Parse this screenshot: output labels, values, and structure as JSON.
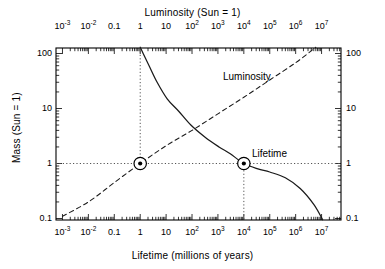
{
  "chart_data": {
    "type": "line",
    "title": "",
    "xlabel": "Lifetime (millions of years)",
    "xlabel_top": "Luminosity (Sun = 1)",
    "ylabel": "Mass (Sun = 1)",
    "ylabel_right": "Mass (Sun = 1)",
    "xscale": "log",
    "yscale": "log",
    "xlim": [
      0.0002,
      20000000
    ],
    "ylim": [
      0.075,
      160
    ],
    "grid": false,
    "xticks_bottom": [
      "10⁻³",
      "10⁻²",
      "0.1",
      "1",
      "10",
      "10²",
      "10³",
      "10⁴",
      "10⁵",
      "10⁶",
      "10⁷"
    ],
    "xticks_top": [
      "10⁻³",
      "10⁻²",
      "0.1",
      "1",
      "10",
      "10²",
      "10³",
      "10⁴",
      "10⁵",
      "10⁶",
      "10⁷"
    ],
    "yticks_left": [
      "100",
      "10",
      "1",
      "0.1"
    ],
    "yticks_right": [
      "100",
      "10",
      "1",
      "0.1"
    ],
    "series": [
      {
        "name": "Lifetime",
        "style": "solid",
        "label": "Lifetime",
        "axis": "bottom",
        "comment": "stellar lifetime in millions of years vs mass (solar units)",
        "points": [
          {
            "lifetime": 1.0,
            "mass": 130
          },
          {
            "lifetime": 1.3,
            "mass": 100
          },
          {
            "lifetime": 2.2,
            "mass": 60
          },
          {
            "lifetime": 4.5,
            "mass": 30
          },
          {
            "lifetime": 11,
            "mass": 15
          },
          {
            "lifetime": 30,
            "mass": 9
          },
          {
            "lifetime": 90,
            "mass": 5
          },
          {
            "lifetime": 320,
            "mass": 3
          },
          {
            "lifetime": 1100,
            "mass": 2
          },
          {
            "lifetime": 3000,
            "mass": 1.5
          },
          {
            "lifetime": 10000,
            "mass": 1.0
          },
          {
            "lifetime": 35000,
            "mass": 0.8
          },
          {
            "lifetime": 100000,
            "mass": 0.7
          },
          {
            "lifetime": 400000,
            "mass": 0.55
          },
          {
            "lifetime": 1500000,
            "mass": 0.35
          },
          {
            "lifetime": 5000000,
            "mass": 0.18
          },
          {
            "lifetime": 11000000,
            "mass": 0.095
          }
        ]
      },
      {
        "name": "Luminosity",
        "style": "dashed",
        "label": "Luminosity",
        "axis": "top",
        "comment": "luminosity in solar units vs mass (solar units)",
        "points": [
          {
            "luminosity": 0.0004,
            "mass": 0.085
          },
          {
            "luminosity": 0.001,
            "mass": 0.11
          },
          {
            "luminosity": 0.01,
            "mass": 0.2
          },
          {
            "luminosity": 0.1,
            "mass": 0.45
          },
          {
            "luminosity": 1.0,
            "mass": 1.0
          },
          {
            "luminosity": 10,
            "mass": 2.1
          },
          {
            "luminosity": 100,
            "mass": 4.0
          },
          {
            "luminosity": 1000,
            "mass": 8.0
          },
          {
            "luminosity": 10000,
            "mass": 16
          },
          {
            "luminosity": 100000,
            "mass": 33
          },
          {
            "luminosity": 1000000,
            "mass": 68
          },
          {
            "luminosity": 6000000,
            "mass": 130
          }
        ]
      }
    ],
    "markers": [
      {
        "name": "sun-luminosity-marker",
        "axis": "top",
        "x": 1.0,
        "y": 1.0,
        "style": "circle-with-dot"
      },
      {
        "name": "sun-lifetime-marker",
        "axis": "bottom",
        "x": 10000,
        "y": 1.0,
        "style": "circle-with-dot"
      }
    ],
    "reference_lines": [
      {
        "name": "luminosity-one-line",
        "orientation": "vertical",
        "axis": "top",
        "value": 1.0,
        "style": "dotted"
      },
      {
        "name": "mass-one-line",
        "orientation": "horizontal",
        "value": 1.0,
        "style": "dotted"
      },
      {
        "name": "lifetime-sun-line",
        "orientation": "vertical",
        "axis": "bottom",
        "value": 10000,
        "style": "dotted"
      }
    ],
    "annotations": [
      {
        "name": "luminosity-curve-label",
        "text": "Luminosity"
      },
      {
        "name": "lifetime-curve-label",
        "text": "Lifetime"
      }
    ],
    "colors": {
      "axis": "#000000",
      "curve": "#1a1a1a",
      "gridline": "#555555",
      "background": "#ffffff"
    }
  }
}
